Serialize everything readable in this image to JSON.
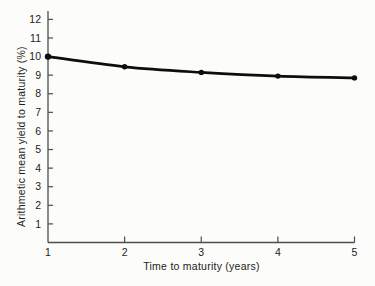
{
  "figure": {
    "background": "#fcfcfa"
  },
  "chart_data": {
    "type": "line",
    "title": "",
    "xlabel": "Time to maturity (years)",
    "ylabel": "Arithmetic mean yield to maturity (%)",
    "x": [
      1,
      2,
      3,
      4,
      5
    ],
    "series": [
      {
        "name": "arithmetic-mean-yield-curve",
        "values": [
          10.0,
          9.45,
          9.15,
          8.95,
          8.85
        ]
      }
    ],
    "xlim": [
      1,
      5
    ],
    "ylim": [
      0,
      12.45
    ],
    "x_ticks": [
      1,
      2,
      3,
      4,
      5
    ],
    "y_ticks": [
      1,
      2,
      3,
      4,
      5,
      6,
      7,
      8,
      9,
      10,
      11,
      12
    ],
    "grid": false,
    "legend": "none",
    "line_color": "#0d0d0d",
    "marker_color": "#0d0d0d",
    "axis_color": "#4d4d4d",
    "label_color": "#1c1c1c"
  }
}
